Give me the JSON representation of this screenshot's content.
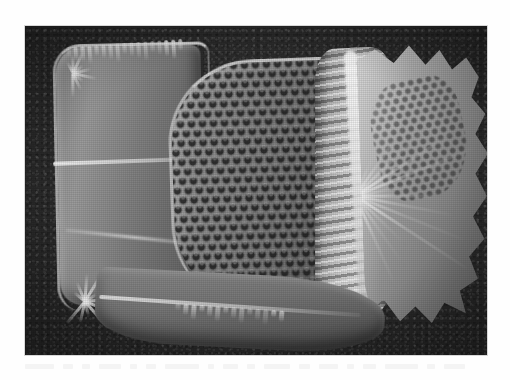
{
  "page": {
    "background_color": "#fefefe",
    "type": "figure-plate"
  },
  "figure": {
    "name": "sem-micrograph",
    "frame": {
      "x": 25,
      "y": 26,
      "width": 462,
      "height": 329
    },
    "image_kind": "grayscale-sem-photomicrograph",
    "background_color": "#2b2b2b",
    "highlight_color": "#d8d8d8",
    "midtone_color": "#8c8c8c",
    "shadow_color": "#4e4e4e"
  },
  "specimen": {
    "label": "microfossil-test",
    "orientation": "lateral",
    "parts": [
      {
        "id": "left-chamber",
        "label": "proximal chamber",
        "texture": "smooth-walled with bright suture rim"
      },
      {
        "id": "center-chamber",
        "label": "median chamber",
        "texture": "hexagonal porous honeycomb"
      },
      {
        "id": "collar",
        "label": "ribbed collar",
        "texture": "transverse ribs / ladder striae"
      },
      {
        "id": "flange",
        "label": "distal flange",
        "texture": "flared with serrated margin and radiating spines"
      },
      {
        "id": "apron",
        "label": "ventral apron",
        "texture": "smooth with toothed ventral edge"
      }
    ],
    "pore_lattice": {
      "arrangement": "hexagonal",
      "approx_pore_diameter_px": 7,
      "approx_spacing_px": 11
    }
  },
  "caption": {
    "visible": false,
    "text": ""
  }
}
